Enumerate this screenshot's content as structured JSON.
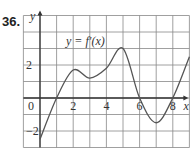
{
  "problem_number": "36.",
  "chart_data": {
    "type": "line",
    "title": "",
    "annotation": "y = f′(x)",
    "xlabel": "x",
    "ylabel": "y",
    "xlim": [
      -1,
      9
    ],
    "ylim": [
      -3,
      5
    ],
    "grid": true,
    "x_ticks": [
      0,
      2,
      4,
      6,
      8
    ],
    "y_ticks": [
      -2,
      2
    ],
    "tick_labels": {
      "x": [
        "0",
        "2",
        "4",
        "6",
        "8"
      ],
      "y": [
        "-2",
        "2"
      ]
    },
    "series": [
      {
        "name": "f'(x)",
        "x": [
          0,
          1,
          2,
          3,
          4,
          5,
          6,
          7,
          8,
          9
        ],
        "values": [
          -2.5,
          0,
          1.7,
          1.2,
          1.8,
          3.0,
          0,
          -1.5,
          0,
          2.5
        ]
      }
    ],
    "color": "#555555"
  }
}
